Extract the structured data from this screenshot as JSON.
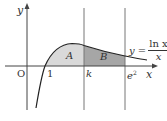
{
  "diagram": {
    "function_label": {
      "prefix": "y =",
      "numerator": "ln x",
      "denominator": "x"
    },
    "axis_labels": {
      "x": "x",
      "y": "y",
      "origin": "O"
    },
    "tick_labels": {
      "one": "1",
      "k": "k",
      "e2": "e",
      "e2_exp": "2"
    },
    "regions": [
      {
        "label": "A",
        "from": "1",
        "to": "k",
        "color": "#d9d9d9"
      },
      {
        "label": "B",
        "from": "k",
        "to": "e²",
        "color": "#a6a6a6"
      }
    ],
    "colors": {
      "axis": "#444444",
      "curve": "#222222",
      "guide": "#666666"
    }
  }
}
